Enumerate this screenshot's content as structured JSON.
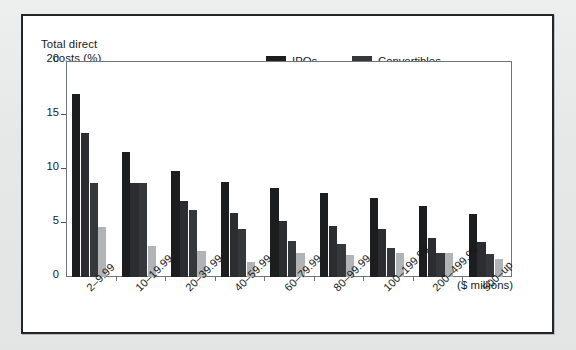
{
  "figure": {
    "background_color": "#e9eaea",
    "panel_background": "#ffffff",
    "panel_border_color": "#23272b"
  },
  "chart_data": {
    "type": "bar",
    "title": "",
    "xlabel": "Proceeds ($ millions)",
    "xlabel_line1": "Proceeds",
    "xlabel_line2": "($ millions)",
    "ylabel": "Total direct costs (%)",
    "ylabel_line1": "Total direct",
    "ylabel_line2": "costs (%)",
    "ylim": [
      0,
      20
    ],
    "yticks": [
      0,
      5,
      10,
      15,
      20
    ],
    "ytick_labels": [
      "0",
      "5",
      "10",
      "15",
      "20"
    ],
    "grid": false,
    "legend_position": "top-center-right",
    "categories": [
      "2–9.99",
      "10–19.99",
      "20–39.99",
      "40–59.99",
      "60–79.99",
      "80–99.99",
      "100–199.99",
      "200–499.99",
      "500–up"
    ],
    "series": [
      {
        "name": "IPOs",
        "color": "#1c1d1f",
        "values": [
          16.9,
          11.6,
          9.8,
          8.8,
          8.2,
          7.8,
          7.3,
          6.6,
          5.8
        ]
      },
      {
        "name": "SEOs",
        "color": "#2b2d30",
        "values": [
          13.3,
          8.7,
          7.0,
          5.9,
          5.2,
          4.7,
          4.4,
          3.6,
          3.2
        ]
      },
      {
        "name": "Convertibles",
        "color": "#35383b",
        "values": [
          8.7,
          8.7,
          6.2,
          4.4,
          3.3,
          3.1,
          2.7,
          2.2,
          2.1
        ]
      },
      {
        "name": "Bonds",
        "color": "#b1b4b6",
        "values": [
          4.6,
          2.9,
          2.4,
          1.4,
          2.2,
          2.0,
          2.2,
          2.2,
          1.7
        ]
      }
    ]
  }
}
